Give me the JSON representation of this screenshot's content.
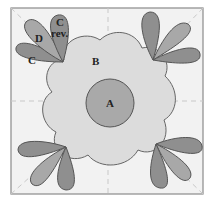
{
  "diagram": {
    "type": "quilt-block-appliqué-layout",
    "labels": {
      "center_circle": "A",
      "flower_body": "B",
      "petal_c": "C",
      "petal_d": "D",
      "petal_c_rev_line1": "C",
      "petal_c_rev_line2": "rev."
    },
    "colors": {
      "background": "#f2f2f2",
      "border": "#8a8a8a",
      "guide_line": "#c8c8c8",
      "flower_body": "#dcdcdc",
      "center_circle": "#a9a9a9",
      "petal_dark": "#8f8f8f",
      "petal_medium": "#a8a8a8",
      "outline": "#555555"
    }
  }
}
